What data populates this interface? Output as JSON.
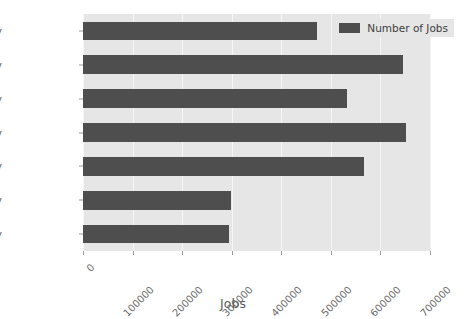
{
  "chart_data": {
    "type": "bar",
    "orientation": "horizontal",
    "title": "",
    "xlabel": "Jobs",
    "ylabel": "",
    "categories": [
      "Monday",
      "Tuesday",
      "Wednesday",
      "Thursday",
      "Friday",
      "Saturday",
      "Sunday"
    ],
    "series": [
      {
        "name": "Number of Jobs",
        "values": [
          473000,
          647000,
          533000,
          652000,
          568000,
          298000,
          294000
        ]
      }
    ],
    "xlim": [
      0,
      703000
    ],
    "xticks": [
      0,
      100000,
      200000,
      300000,
      400000,
      500000,
      600000,
      700000
    ],
    "xtick_labels": [
      "0",
      "100000",
      "200000",
      "300000",
      "400000",
      "500000",
      "600000",
      "700000"
    ],
    "xtick_label_rotation": -45,
    "grid": true,
    "grid_axis": "x",
    "legend": {
      "entries": [
        "Number of Jobs"
      ],
      "position": "upper right"
    },
    "colors": {
      "bar": "#4e4e4e",
      "plot_background": "#e6e6e6",
      "figure_background": "#ffffff",
      "gridline": "#f6f6f6",
      "tick_text": "#5b5b5b"
    }
  }
}
